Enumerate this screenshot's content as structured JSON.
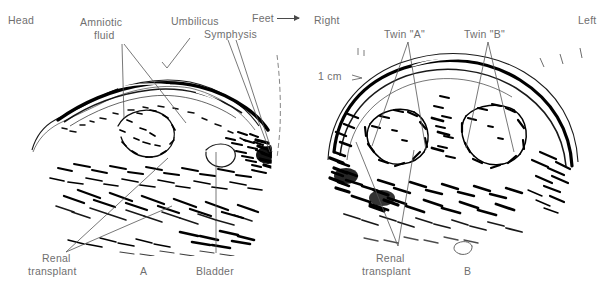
{
  "figure": {
    "kind": "ultrasound-figure",
    "background_color": "#ffffff",
    "ink_color": "#000000",
    "label_color": "#6f6f6f",
    "leader_color": "#555555",
    "panel_count": 2
  },
  "panel_a": {
    "letter": "A",
    "view": "sagittal",
    "labels": {
      "head": "Head",
      "amniotic_fluid_line1": "Amniotic",
      "amniotic_fluid_line2": "fluid",
      "umbilicus": "Umbilicus",
      "symphysis": "Symphysis",
      "feet": "Feet",
      "renal_line1": "Renal",
      "renal_line2": "transplant",
      "bladder": "Bladder"
    }
  },
  "panel_b": {
    "letter": "B",
    "view": "transverse",
    "labels": {
      "right": "Right",
      "left": "Left",
      "scale": "1 cm",
      "twin_a": "Twin \"A\"",
      "twin_b": "Twin \"B\"",
      "renal_line1": "Renal",
      "renal_line2": "transplant"
    }
  }
}
